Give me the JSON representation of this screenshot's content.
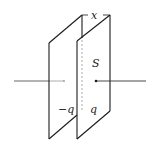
{
  "diagram": {
    "labels": {
      "separation": "x",
      "area": "S",
      "left_charge": "−q",
      "right_charge": "q"
    },
    "colors": {
      "line": "#1a1a1a",
      "hidden_line": "#9a9a9a",
      "wire_inside": "#8a8a8a",
      "background": "#ffffff"
    }
  }
}
